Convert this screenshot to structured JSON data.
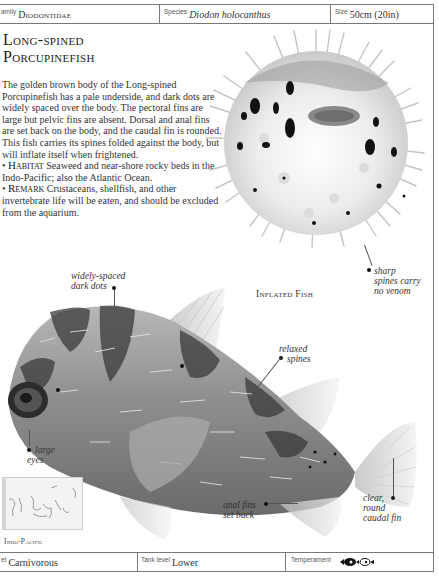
{
  "header": {
    "family": {
      "label": "Family",
      "label_visible": "amily",
      "value": "Diodontidae"
    },
    "species": {
      "label": "Species",
      "value": "Diodon holocanthus"
    },
    "size": {
      "label": "Size",
      "value": "50cm (20in)"
    }
  },
  "title": {
    "line1": "Long-spined",
    "line2": "Porcupinefish"
  },
  "description": {
    "body": "The golden brown body of the Long-spined Porcupinefish has a pale underside, and dark dots are widely spaced over the body. The pectoral fins are large but pelvic fins are absent. Dorsal and anal fins are set back on the body, and the caudal fin is rounded. This fish carries its spines folded against the body, but will inflate itself when frightened.",
    "habitat_label": "Habitat",
    "habitat_text": "Seaweed and near-shore rocky beds in the Indo-Pacific; also the Atlantic Ocean.",
    "remark_label": "Remark",
    "remark_text": "Crustaceans, shellfish, and other invertebrate life will be eaten, and should be excluded from the aquarium.",
    "bullet": "•"
  },
  "images": {
    "inflated_caption": "Inflated Fish"
  },
  "annotations": {
    "sharp_spines": "sharp spines carry no venom",
    "sharp_spines_l1": "sharp",
    "sharp_spines_l2": "spines carry",
    "sharp_spines_l3": "no venom",
    "dots_l1": "widely-spaced",
    "dots_l2": "dark dots",
    "relaxed_l1": "relaxed",
    "relaxed_l2": "spines",
    "eyes_l1": "large",
    "eyes_l2": "eyes",
    "anal_l1": "anal fins",
    "anal_l2": "set back",
    "caudal_l1": "clear,",
    "caudal_l2": "round",
    "caudal_l3": "caudal fin"
  },
  "map": {
    "region": "Indo-Pacific"
  },
  "footer": {
    "diet": {
      "label": "Diet",
      "label_visible": "et",
      "value": "Carnivorous"
    },
    "tank_level": {
      "label": "Tank level",
      "value": "Lower"
    },
    "temperament": {
      "label": "Temperament",
      "icon": "fish-temperament-icons"
    }
  },
  "colors": {
    "border": "#777777",
    "text": "#333333",
    "background": "#ffffff"
  }
}
